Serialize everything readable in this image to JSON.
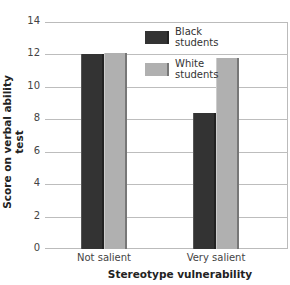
{
  "chart_data": {
    "type": "bar",
    "title": "",
    "xlabel": "Stereotype vulnerability",
    "ylabel": "Score on verbal ability test",
    "categories": [
      "Not salient",
      "Very salient"
    ],
    "series": [
      {
        "name": "Black students",
        "color": "#333333",
        "values": [
          12.0,
          8.4
        ]
      },
      {
        "name": "White students",
        "color": "#b0b0b0",
        "values": [
          12.1,
          11.8
        ]
      }
    ],
    "ylim": [
      0,
      14
    ],
    "yticks": [
      0,
      2,
      4,
      6,
      8,
      10,
      12,
      14
    ],
    "grid": true,
    "legend_position": "upper-right-inside"
  },
  "legend": {
    "black": [
      "Black",
      "students"
    ],
    "white": [
      "White",
      "students"
    ]
  }
}
